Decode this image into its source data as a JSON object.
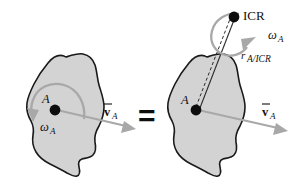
{
  "figure": {
    "colors": {
      "body_fill": "#d3d3d3",
      "body_outline": "#1a1a1a",
      "vector_gray": "#a8a8a8",
      "marker_black": "#0d0d0d",
      "background": "#ffffff"
    },
    "equals_sign": "=",
    "left_panel": {
      "name": "general-plane-motion",
      "body_label": "rigid-body-outline",
      "point_label": "A",
      "angular_velocity": {
        "symbol": "ω",
        "subscript": "A"
      },
      "velocity": {
        "symbol": "v",
        "subscript": "A",
        "accent": "overbar-arrow"
      }
    },
    "right_panel": {
      "name": "pure-rotation-about-icr",
      "body_label": "rigid-body-outline",
      "point_label": "A",
      "icr_label": "ICR",
      "angular_velocity": {
        "symbol": "ω",
        "subscript": "A"
      },
      "velocity": {
        "symbol": "v",
        "subscript": "A",
        "accent": "overbar-arrow"
      },
      "radius": {
        "symbol": "r",
        "subscript": "A/ICR"
      }
    }
  }
}
